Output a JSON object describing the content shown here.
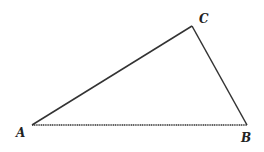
{
  "diagram": {
    "type": "triangle",
    "vertices": [
      {
        "label": "A",
        "x": 32,
        "y": 125,
        "lx": 16,
        "ly": 137
      },
      {
        "label": "B",
        "x": 247,
        "y": 125,
        "lx": 241,
        "ly": 142
      },
      {
        "label": "C",
        "x": 192,
        "y": 26,
        "lx": 199,
        "ly": 23
      }
    ],
    "stroke_color": "#333333"
  }
}
